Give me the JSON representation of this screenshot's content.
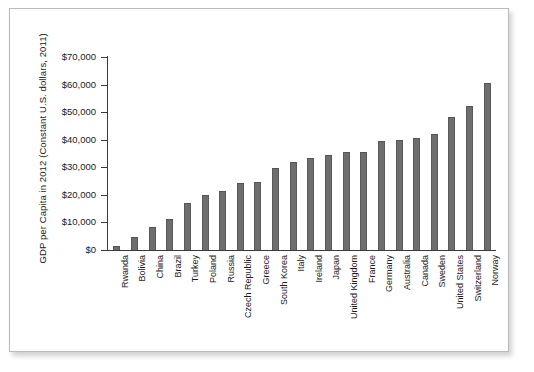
{
  "chart_data": {
    "type": "bar",
    "title": "",
    "subtitle": "",
    "xlabel": "",
    "ylabel": "GDP per Capita in 2012 (Constant U.S. dollars, 2011)",
    "ylim": [
      0,
      70000
    ],
    "ytick_labels": [
      "$70,000",
      "$60,000",
      "$50,000",
      "$40,000",
      "$30,000",
      "$20,000",
      "$10,000",
      "$0"
    ],
    "ytick_values": [
      70000,
      60000,
      50000,
      40000,
      30000,
      20000,
      10000,
      0
    ],
    "grid": false,
    "legend": null,
    "bar_color": "#6e6e6e",
    "axis_color": "#3a3a3a",
    "categories": [
      "Rwanda",
      "Bolivia",
      "China",
      "Brazil",
      "Turkey",
      "Poland",
      "Russia",
      "Czech Republic",
      "Greece",
      "South Korea",
      "Italy",
      "Ireland",
      "Japan",
      "United Kingdom",
      "France",
      "Germany",
      "Australia",
      "Canada",
      "Sweden",
      "United States",
      "Switzerland",
      "Norway"
    ],
    "values": [
      1400,
      4600,
      8400,
      11300,
      17000,
      20000,
      21500,
      24300,
      24800,
      29600,
      32100,
      33200,
      34500,
      35500,
      35700,
      39700,
      40000,
      40800,
      41900,
      48400,
      52100,
      60700
    ]
  }
}
